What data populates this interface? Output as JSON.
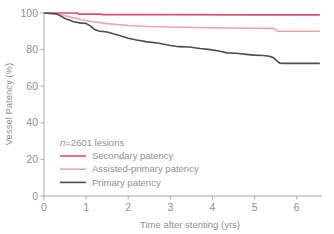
{
  "chart_data": {
    "type": "line",
    "title": "",
    "subtitle": "",
    "xlabel": "Time after stenting (yrs)",
    "ylabel": "Vessel Patency (%)",
    "xlim": [
      0,
      6.6
    ],
    "ylim": [
      0,
      100
    ],
    "xticks": [
      0,
      1,
      2,
      3,
      4,
      5,
      6
    ],
    "xtick_labels": [
      "0",
      "1",
      "2",
      "3",
      "4",
      "5",
      "6"
    ],
    "yticks": [
      0,
      20,
      40,
      60,
      80,
      100
    ],
    "ytick_labels": [
      "0",
      "20",
      "40",
      "60",
      "80",
      "100"
    ],
    "grid": false,
    "legend_position": "lower-left-inside",
    "annotation": "n=2601 lesions",
    "annotation_italic_prefix": "n",
    "annotation_rest": "=2601 lesions",
    "series": [
      {
        "name": "Secondary patency",
        "color": "#d94f6e",
        "linewidth": 1.6,
        "x": [
          0,
          0.35,
          0.8,
          0.82,
          1.35,
          1.38,
          3.0,
          5.0,
          6.55
        ],
        "y": [
          100,
          100,
          100,
          99.4,
          99.4,
          99.1,
          99.1,
          99.0,
          99.0
        ]
      },
      {
        "name": "Assisted-primary patency",
        "color": "#f4a0b4",
        "linewidth": 1.6,
        "x": [
          0,
          0.3,
          0.6,
          1.0,
          1.5,
          2.0,
          2.5,
          3.2,
          4.0,
          4.8,
          5.45,
          5.55,
          6.0,
          6.55
        ],
        "y": [
          100,
          99.6,
          98.0,
          95.8,
          94.2,
          93.2,
          92.6,
          92.2,
          91.9,
          91.7,
          91.6,
          90.1,
          90.0,
          90.0
        ]
      },
      {
        "name": "Primary patency",
        "color": "#4d4d4d",
        "linewidth": 1.6,
        "x": [
          0,
          0.3,
          0.5,
          0.7,
          0.85,
          1.0,
          1.1,
          1.2,
          1.3,
          1.5,
          1.75,
          2.0,
          2.2,
          2.45,
          2.7,
          3.0,
          3.2,
          3.45,
          3.7,
          3.95,
          4.15,
          4.35,
          4.55,
          4.8,
          5.0,
          5.2,
          5.35,
          5.45,
          5.5,
          5.6,
          5.7,
          6.0,
          6.55
        ],
        "y": [
          100,
          99.5,
          97.0,
          95.2,
          94.6,
          94.3,
          93.0,
          91.0,
          90.2,
          89.6,
          88.0,
          86.2,
          85.2,
          84.2,
          83.6,
          82.2,
          81.6,
          81.4,
          80.6,
          80.0,
          79.2,
          78.2,
          78.0,
          77.4,
          77.0,
          76.8,
          76.4,
          75.6,
          74.4,
          72.6,
          72.5,
          72.5,
          72.5
        ]
      }
    ]
  },
  "legend": {
    "items": [
      {
        "label": "Secondary patency",
        "color": "#d94f6e"
      },
      {
        "label": "Assisted-primary patency",
        "color": "#f4a0b4"
      },
      {
        "label": "Primary patency",
        "color": "#4d4d4d"
      }
    ]
  },
  "colors": {
    "axis": "#a8a8a8",
    "text": "#8f8f8f",
    "background": "#ffffff"
  }
}
